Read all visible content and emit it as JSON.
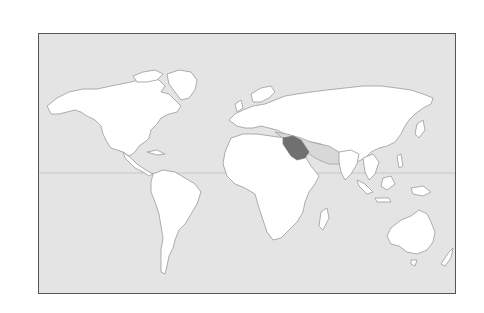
{
  "map": {
    "type": "world-locator-map",
    "projection": "equirectangular",
    "highlighted_country": "Saudi Arabia",
    "colors": {
      "ocean": "#e4e4e4",
      "land": "#ffffff",
      "coastline": "#9a9a9a",
      "highlight": "#707070",
      "neighbor_region": "#d8d8d8",
      "frame": "#555555"
    },
    "show_equator": true
  }
}
